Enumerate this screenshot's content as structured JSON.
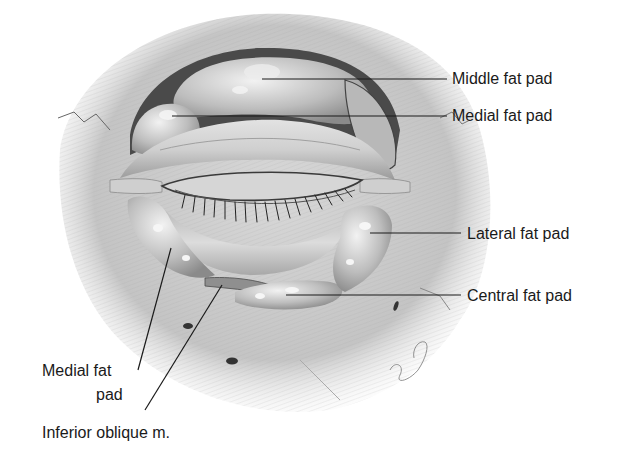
{
  "figure": {
    "labels": [
      {
        "id": "middle-fat-pad",
        "text": "Middle fat pad",
        "x": 452,
        "y": 64
      },
      {
        "id": "medial-fat-pad-upper",
        "text": "Medial fat pad",
        "x": 452,
        "y": 107
      },
      {
        "id": "lateral-fat-pad",
        "text": "Lateral fat pad",
        "x": 467,
        "y": 227
      },
      {
        "id": "central-fat-pad",
        "text": "Central fat pad",
        "x": 467,
        "y": 288
      },
      {
        "id": "medial-fat-pad-lower-line1",
        "text": "Medial fat",
        "x": 42,
        "y": 362
      },
      {
        "id": "medial-fat-pad-lower-line2",
        "text": "pad",
        "x": 96,
        "y": 386
      },
      {
        "id": "inferior-oblique",
        "text": "Inferior oblique m.",
        "x": 42,
        "y": 424
      }
    ],
    "leader_lines": [
      {
        "for": "middle-fat-pad",
        "x1": 262,
        "y1": 79,
        "x2": 447,
        "y2": 79
      },
      {
        "for": "medial-fat-pad-upper",
        "x1": 172,
        "y1": 116,
        "x2": 447,
        "y2": 116
      },
      {
        "for": "lateral-fat-pad",
        "x1": 370,
        "y1": 233,
        "x2": 461,
        "y2": 233
      },
      {
        "for": "central-fat-pad",
        "x1": 286,
        "y1": 295,
        "x2": 461,
        "y2": 295
      },
      {
        "for": "medial-fat-pad-lower",
        "x1": 171,
        "y1": 248,
        "x2": 138,
        "y2": 370
      },
      {
        "for": "inferior-oblique",
        "x1": 222,
        "y1": 285,
        "x2": 145,
        "y2": 410
      }
    ]
  }
}
